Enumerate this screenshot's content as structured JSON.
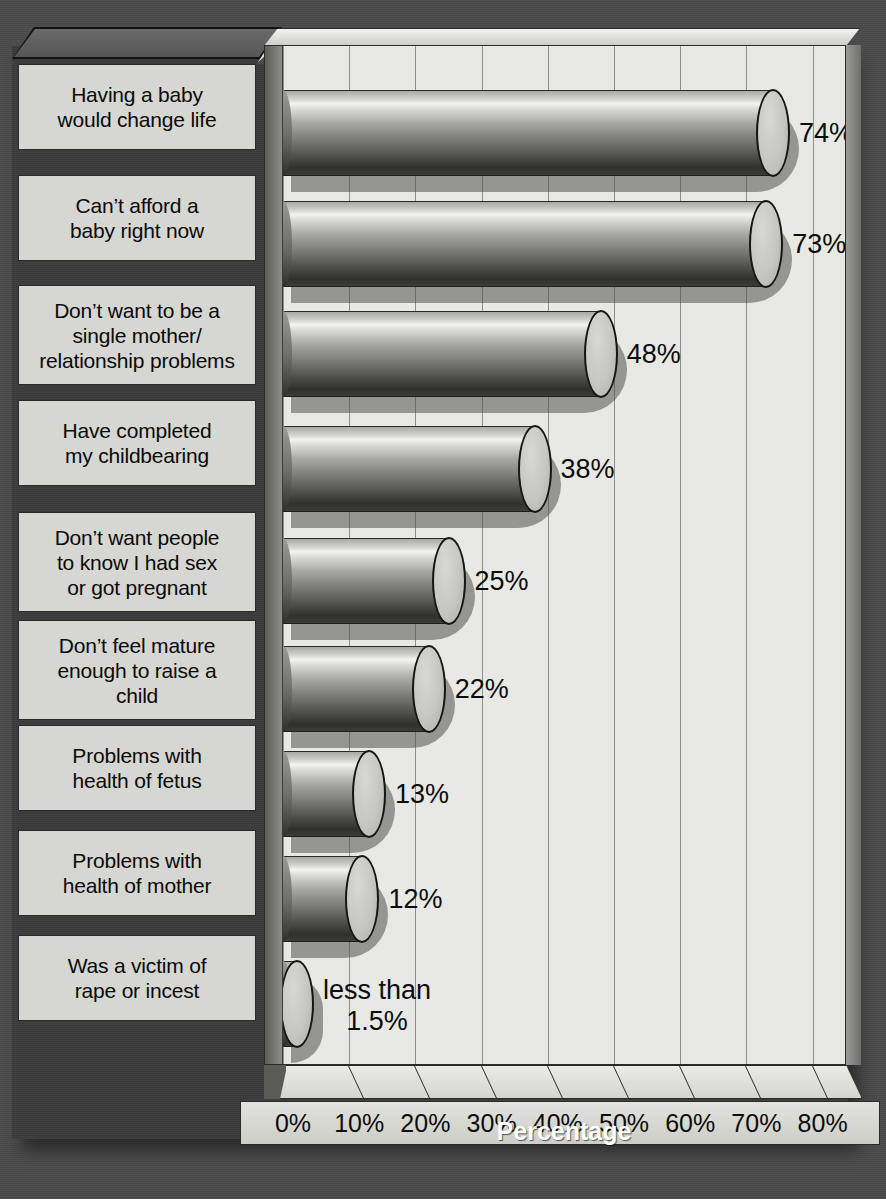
{
  "chart_data": {
    "type": "bar",
    "orientation": "horizontal",
    "title": "",
    "xlabel": "Percentage",
    "ylabel": "",
    "xlim": [
      0,
      85
    ],
    "grid": true,
    "legend": "none",
    "categories": [
      "Having a baby\nwould change life",
      "Can’t afford a\nbaby right now",
      "Don’t want to be a\nsingle mother/\nrelationship problems",
      "Have completed\nmy childbearing",
      "Don’t want people\nto know I had sex\nor got pregnant",
      "Don’t feel mature\nenough to raise a\nchild",
      "Problems with\nhealth of fetus",
      "Problems with\nhealth of mother",
      "Was a victim of\nrape or incest"
    ],
    "values": [
      74,
      73,
      48,
      38,
      25,
      22,
      13,
      12,
      1.5
    ],
    "value_labels": [
      "74%",
      "73%",
      "48%",
      "38%",
      "25%",
      "22%",
      "13%",
      "12%",
      "less than\n1.5%"
    ],
    "xticks": [
      0,
      10,
      20,
      30,
      40,
      50,
      60,
      70,
      80
    ],
    "xticklabels": [
      "0%",
      "10%",
      "20%",
      "30%",
      "40%",
      "50%",
      "60%",
      "70%",
      "80%"
    ]
  },
  "colors": {
    "background": "#4b4b4b",
    "frame": "#3c3c3c",
    "plot_area": "#e8e8e4",
    "label_band": "#d6d6d2",
    "gridline": "#8e8e8a",
    "text": "#0d0d0d",
    "axis_title_text": "#ffffff"
  }
}
